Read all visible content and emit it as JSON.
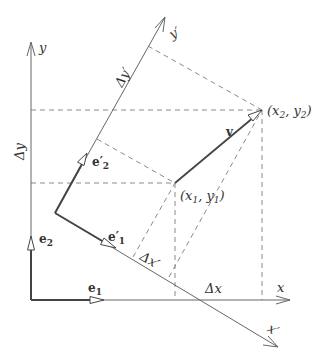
{
  "labels": {
    "y_axis": "y",
    "x_axis": "x",
    "y_prime_axis": "y′",
    "x_prime_axis": "x′",
    "delta_y": "Δy",
    "delta_x": "Δx",
    "delta_y_prime": "Δy′",
    "delta_x_prime": "Δx′",
    "e1": "e",
    "e1_sub": "1",
    "e2": "e",
    "e2_sub": "2",
    "e1_prime": "e′",
    "e1_prime_sub": "1",
    "e2_prime": "e′",
    "e2_prime_sub": "2",
    "vector_v": "v",
    "point1": "(x",
    "point1_sub1": "1",
    "point1_mid": ", y",
    "point1_sub2": "1",
    "point1_end": ")",
    "point2": "(x",
    "point2_sub1": "2",
    "point2_mid": ", y",
    "point2_sub2": "2",
    "point2_end": ")"
  },
  "colors": {
    "axis": "#555555",
    "dashed": "#888888",
    "text": "#333333"
  }
}
